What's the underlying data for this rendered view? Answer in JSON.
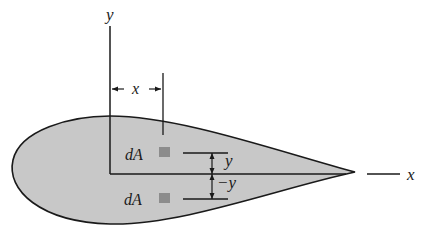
{
  "diagram": {
    "type": "cross-section area with symmetric elements",
    "colors": {
      "fill": "#c8c8c8",
      "outline": "#1a1a1a",
      "element": "#8c8c8c",
      "background": "#ffffff"
    },
    "axes": {
      "y_label": "y",
      "x_label": "x"
    },
    "dimensions": {
      "horizontal_offset_label": "x",
      "upper_offset_label": "y",
      "lower_offset_label": "−y"
    },
    "elements": [
      {
        "label": "dA",
        "position": "above x-axis"
      },
      {
        "label": "dA",
        "position": "below x-axis"
      }
    ]
  }
}
